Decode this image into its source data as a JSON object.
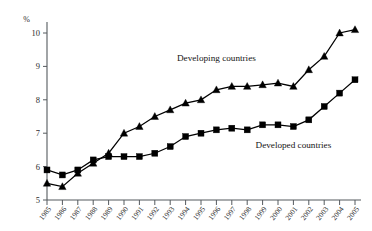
{
  "chart_data": {
    "type": "line",
    "title": "",
    "xlabel": "",
    "ylabel": "%",
    "ylim": [
      5,
      10.5
    ],
    "yticks": [
      5,
      6,
      7,
      8,
      9,
      10
    ],
    "ytick_labels": [
      "5",
      "6",
      "7",
      "8",
      "9",
      "10"
    ],
    "grid": false,
    "legend_position": "inline-annotations",
    "categories": [
      "1985",
      "1986",
      "1987",
      "1988",
      "1989",
      "1990",
      "1991",
      "1992",
      "1993",
      "1994",
      "1995",
      "1996",
      "1997",
      "1998",
      "1999",
      "2000",
      "2001",
      "2002",
      "2003",
      "2004",
      "2005"
    ],
    "series": [
      {
        "name": "Developing countries",
        "marker": "triangle",
        "values": [
          5.5,
          5.4,
          5.8,
          6.1,
          6.4,
          7.0,
          7.2,
          7.5,
          7.7,
          7.9,
          8.0,
          8.3,
          8.4,
          8.4,
          8.45,
          8.5,
          8.4,
          8.9,
          9.3,
          10.0,
          10.1
        ]
      },
      {
        "name": "Developed countries",
        "marker": "square",
        "values": [
          5.9,
          5.75,
          5.9,
          6.2,
          6.3,
          6.3,
          6.3,
          6.4,
          6.6,
          6.9,
          7.0,
          7.1,
          7.15,
          7.1,
          7.25,
          7.25,
          7.2,
          7.4,
          7.8,
          8.2,
          8.6
        ]
      }
    ],
    "annotations": [
      {
        "text": "Developing countries",
        "x": 1996,
        "y": 9.15
      },
      {
        "text": "Developed countries",
        "x": 2001,
        "y": 6.55
      }
    ]
  }
}
